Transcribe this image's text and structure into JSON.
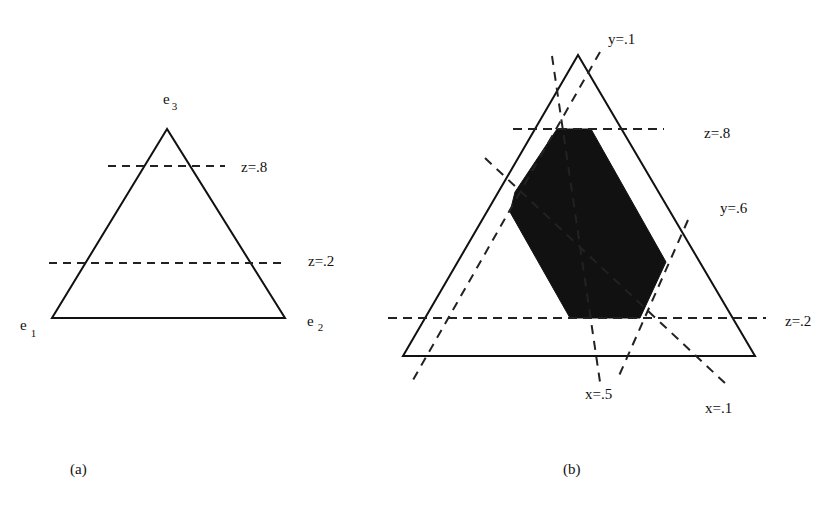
{
  "diagram": {
    "panel_a": {
      "caption": "(a)",
      "vertices": {
        "e1": {
          "base": "e",
          "sub": "1"
        },
        "e2": {
          "base": "e",
          "sub": "2"
        },
        "e3": {
          "base": "e",
          "sub": "3"
        }
      },
      "lines": [
        {
          "label": "z=.8",
          "style": "dashed"
        },
        {
          "label": "z=.2",
          "style": "dashed"
        }
      ]
    },
    "panel_b": {
      "caption": "(b)",
      "lines": [
        {
          "label": "y=.1",
          "style": "dashed"
        },
        {
          "label": "z=.8",
          "style": "dashed"
        },
        {
          "label": "y=.6",
          "style": "dashed"
        },
        {
          "label": "z=.2",
          "style": "dashed"
        },
        {
          "label": "x=.5",
          "style": "dashed"
        },
        {
          "label": "x=.1",
          "style": "dashed"
        }
      ],
      "shaded_region": "feasible region (filled black hexagon)"
    }
  }
}
